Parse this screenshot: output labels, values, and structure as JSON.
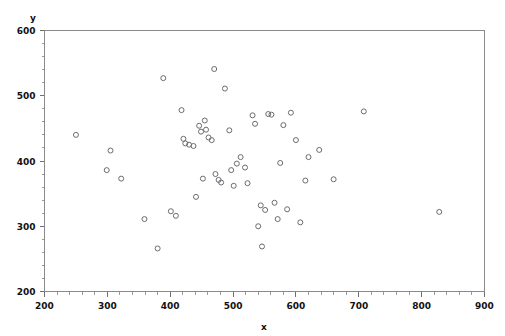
{
  "chart_data": {
    "type": "scatter",
    "title": "",
    "xlabel": "x",
    "ylabel": "y",
    "xlim": [
      200,
      900
    ],
    "ylim": [
      200,
      600
    ],
    "x_ticks": [
      200,
      300,
      400,
      500,
      600,
      700,
      800,
      900
    ],
    "y_ticks": [
      200,
      300,
      400,
      500,
      600
    ],
    "x_tick_labels": [
      "200",
      "300",
      "400",
      "500",
      "600",
      "700",
      "800",
      "900"
    ],
    "y_tick_labels": [
      "200",
      "300",
      "400",
      "500",
      "600"
    ],
    "x_minor_tick_step": 20,
    "y_minor_tick_step": 20,
    "grid": false,
    "legend": false,
    "legend_position": "none",
    "marker": {
      "shape": "circle-open",
      "size_px": 5,
      "stroke_color": "#6b6b72",
      "fill": "none",
      "stroke_width": 1
    },
    "frame_color": "#8a8a8a",
    "background_color": "#ffffff",
    "n_points": 56,
    "points": [
      [
        250,
        440
      ],
      [
        299,
        386
      ],
      [
        305,
        416
      ],
      [
        322,
        373
      ],
      [
        359,
        311
      ],
      [
        380,
        266
      ],
      [
        389,
        527
      ],
      [
        401,
        323
      ],
      [
        409,
        316
      ],
      [
        418,
        478
      ],
      [
        421,
        434
      ],
      [
        424,
        427
      ],
      [
        430,
        425
      ],
      [
        437,
        423
      ],
      [
        441,
        345
      ],
      [
        446,
        454
      ],
      [
        449,
        445
      ],
      [
        452,
        373
      ],
      [
        455,
        462
      ],
      [
        457,
        448
      ],
      [
        461,
        436
      ],
      [
        466,
        432
      ],
      [
        470,
        541
      ],
      [
        472,
        380
      ],
      [
        477,
        371
      ],
      [
        481,
        367
      ],
      [
        487,
        511
      ],
      [
        494,
        447
      ],
      [
        497,
        386
      ],
      [
        501,
        362
      ],
      [
        506,
        396
      ],
      [
        512,
        406
      ],
      [
        519,
        390
      ],
      [
        523,
        366
      ],
      [
        531,
        470
      ],
      [
        535,
        457
      ],
      [
        540,
        300
      ],
      [
        544,
        332
      ],
      [
        546,
        269
      ],
      [
        551,
        325
      ],
      [
        556,
        472
      ],
      [
        561,
        471
      ],
      [
        566,
        336
      ],
      [
        571,
        311
      ],
      [
        575,
        397
      ],
      [
        580,
        455
      ],
      [
        586,
        326
      ],
      [
        592,
        474
      ],
      [
        600,
        432
      ],
      [
        607,
        306
      ],
      [
        615,
        370
      ],
      [
        620,
        406
      ],
      [
        637,
        417
      ],
      [
        660,
        372
      ],
      [
        708,
        476
      ],
      [
        828,
        322
      ]
    ]
  },
  "axis": {
    "y_axis_title": "y",
    "x_axis_title": "x"
  }
}
